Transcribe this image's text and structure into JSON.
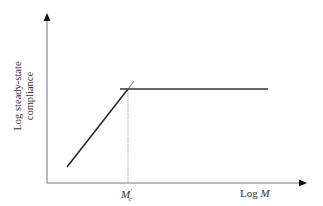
{
  "diagram": {
    "y_axis_label_line1": "Log steady-state",
    "y_axis_label_line2": "compliance",
    "x_axis_label_prefix": "Log ",
    "x_axis_label_var": "M",
    "critical_mass_label": "M",
    "critical_mass_sub": "c",
    "critical_mass_prime": "′"
  }
}
